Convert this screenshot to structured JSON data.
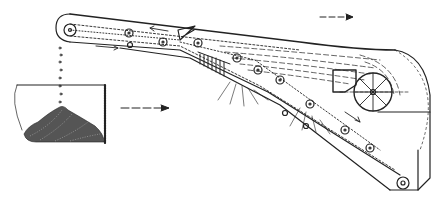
{
  "figure": {
    "type": "technical line drawing",
    "colors": {
      "ink": "#222222",
      "background": "#ffffff",
      "material": "#555555"
    },
    "elements": {
      "motion_arrow_top": {
        "direction": "bidirectional horizontal",
        "position": "top right"
      },
      "motion_arrow_left": {
        "direction": "bidirectional horizontal",
        "position": "middle left"
      },
      "bin": {
        "content": "granular material pile"
      },
      "drum": {
        "spokes": 8
      },
      "sprockets_top": 7,
      "sprockets_bottom": 8
    },
    "text_labels": []
  }
}
